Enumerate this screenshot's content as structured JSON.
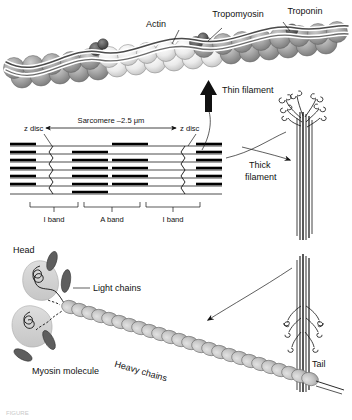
{
  "figure": {
    "background_color": "#ffffff",
    "ink_color": "#111111"
  },
  "thin_filament_panel": {
    "labels": {
      "actin": "Actin",
      "tropomyosin": "Tropomyosin",
      "troponin": "Troponin",
      "thin_filament": "Thin filament"
    },
    "bead_colors": {
      "dark_actin": "#9a9a9a",
      "light_actin": "#e8e8e8",
      "troponin": "#5a5a5a",
      "tropomyosin_strand": "#6f6f6f"
    }
  },
  "sarcomere_panel": {
    "labels": {
      "sarcomere": "Sarcomere –2.5 μm",
      "z_disc_left": "z disc",
      "z_disc_right": "z disc",
      "i_band_left": "I band",
      "a_band": "A band",
      "i_band_right": "I band"
    },
    "measurements": {
      "sarcomere_length": "2.5 μm"
    }
  },
  "thick_filament_panel": {
    "labels": {
      "thick_filament_line1": "Thick",
      "thick_filament_line2": "filament"
    }
  },
  "myosin_panel": {
    "labels": {
      "head": "Head",
      "light_chains": "Light chains",
      "myosin_molecule": "Myosin molecule",
      "heavy_chains": "Heavy chains",
      "tail": "Tail"
    },
    "colors": {
      "head_fill": "#d4d4d4",
      "light_chain_fill": "#6b6b6b",
      "heavy_chain_bead": "#c4c4c4"
    }
  },
  "caption": {
    "text": "FIGURE"
  }
}
